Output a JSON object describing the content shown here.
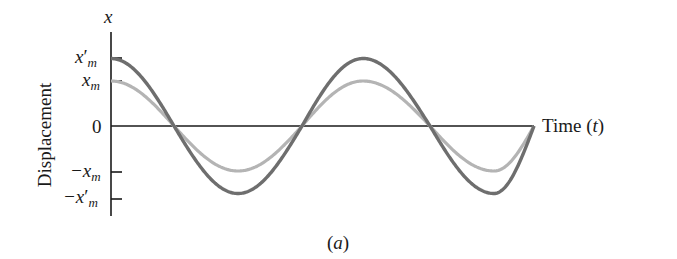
{
  "chart_data": {
    "type": "line",
    "title": "",
    "caption": "(a)",
    "xlabel": "Time (t)",
    "ylabel": "Displacement",
    "y_axis_symbol": "x",
    "y_ticks": [
      {
        "label": "x'm",
        "value": 1.5
      },
      {
        "label": "xm",
        "value": 1.0
      },
      {
        "label": "0",
        "value": 0
      },
      {
        "label": "-xm",
        "value": -1.0
      },
      {
        "label": "-x'm",
        "value": -1.5
      }
    ],
    "grid": false,
    "legend": null,
    "series": [
      {
        "name": "amplitude x'm (larger)",
        "function": "x'm cos(ωt)",
        "amplitude": 1.5,
        "color": "#6e6e6e",
        "periods_shown": 1.75
      },
      {
        "name": "amplitude xm (smaller)",
        "function": "xm cos(ωt)",
        "amplitude": 1.0,
        "color": "#b4b4b4",
        "periods_shown": 1.75
      }
    ]
  },
  "labels": {
    "y_axis_symbol": "x",
    "tick_xpm_main": "x",
    "tick_xpm_prime": "′",
    "tick_xpm_sub": "m",
    "tick_xm_main": "x",
    "tick_xm_sub": "m",
    "tick_zero": "0",
    "tick_neg_xm_main": "−x",
    "tick_neg_xm_sub": "m",
    "tick_neg_xpm_main": "−x",
    "tick_neg_xpm_prime": "′",
    "tick_neg_xpm_sub": "m",
    "ylabel": "Displacement",
    "xlabel_main": "Time (",
    "xlabel_var": "t",
    "xlabel_close": ")",
    "caption_open": "(",
    "caption_var": "a",
    "caption_close": ")"
  },
  "colors": {
    "dark_curve": "#6e6e6e",
    "light_curve": "#b4b4b4",
    "axis": "#1a1a1a"
  }
}
